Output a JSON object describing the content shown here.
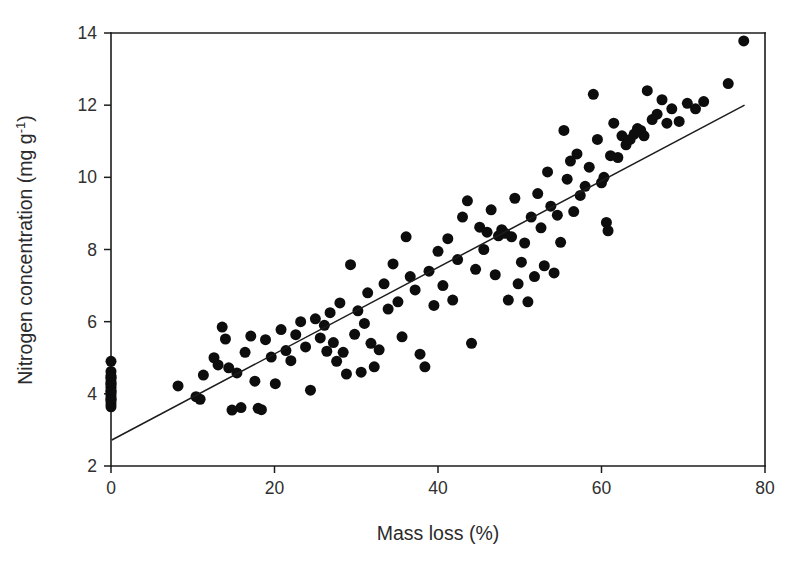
{
  "figure": {
    "background_color": "#ffffff",
    "marker_color": "#0d0d0d",
    "line_color": "#1c1c1c",
    "marker_diameter_px": 11
  },
  "axes": {
    "x_title": "Mass loss (%)",
    "y_title_main": "Nitrogen concentration (mg g",
    "y_title_sup": "-1",
    "y_title_close": ")",
    "x_ticks": [
      "0",
      "20",
      "40",
      "60",
      "80"
    ],
    "y_ticks": [
      "2",
      "4",
      "6",
      "8",
      "10",
      "12",
      "14"
    ]
  },
  "chart_data": {
    "type": "scatter",
    "title": "",
    "xlabel": "Mass loss (%)",
    "ylabel": "Nitrogen concentration (mg g-1)",
    "xlim": [
      0,
      80
    ],
    "ylim": [
      2,
      14
    ],
    "xticks": [
      0,
      20,
      40,
      60,
      80
    ],
    "yticks": [
      2,
      4,
      6,
      8,
      10,
      12,
      14
    ],
    "grid": false,
    "legend": null,
    "series": [
      {
        "name": "observations",
        "marker": "filled-circle",
        "color": "#0d0d0d",
        "points": [
          [
            0,
            4.9
          ],
          [
            0,
            4.62
          ],
          [
            0,
            4.5
          ],
          [
            0,
            4.42
          ],
          [
            0,
            4.33
          ],
          [
            0,
            4.25
          ],
          [
            0,
            4.18
          ],
          [
            0,
            4.1
          ],
          [
            0,
            4.02
          ],
          [
            0,
            3.95
          ],
          [
            0,
            3.88
          ],
          [
            0,
            3.8
          ],
          [
            0,
            3.72
          ],
          [
            0,
            3.64
          ],
          [
            0,
            4.46
          ],
          [
            0,
            4.28
          ],
          [
            0,
            4.06
          ],
          [
            0,
            3.84
          ],
          [
            8.2,
            4.22
          ],
          [
            10.4,
            3.92
          ],
          [
            10.9,
            3.85
          ],
          [
            11.3,
            4.52
          ],
          [
            12.6,
            5.0
          ],
          [
            13.1,
            4.8
          ],
          [
            13.6,
            5.85
          ],
          [
            14.0,
            5.52
          ],
          [
            14.4,
            4.72
          ],
          [
            14.8,
            3.55
          ],
          [
            15.4,
            4.58
          ],
          [
            15.9,
            3.62
          ],
          [
            16.4,
            5.15
          ],
          [
            17.1,
            5.6
          ],
          [
            17.6,
            4.35
          ],
          [
            18.0,
            3.6
          ],
          [
            18.4,
            3.56
          ],
          [
            18.9,
            5.5
          ],
          [
            19.6,
            5.02
          ],
          [
            20.1,
            4.28
          ],
          [
            20.8,
            5.78
          ],
          [
            21.4,
            5.2
          ],
          [
            22.0,
            4.92
          ],
          [
            22.6,
            5.64
          ],
          [
            23.2,
            6.0
          ],
          [
            23.8,
            5.3
          ],
          [
            24.4,
            4.1
          ],
          [
            25.0,
            6.08
          ],
          [
            25.6,
            5.55
          ],
          [
            26.1,
            5.9
          ],
          [
            26.4,
            5.18
          ],
          [
            26.8,
            6.25
          ],
          [
            27.2,
            5.42
          ],
          [
            27.6,
            4.9
          ],
          [
            28.0,
            6.52
          ],
          [
            28.4,
            5.15
          ],
          [
            28.8,
            4.55
          ],
          [
            29.3,
            7.58
          ],
          [
            29.8,
            5.65
          ],
          [
            30.2,
            6.3
          ],
          [
            30.6,
            4.6
          ],
          [
            31.0,
            5.95
          ],
          [
            31.4,
            6.8
          ],
          [
            31.8,
            5.4
          ],
          [
            32.2,
            4.75
          ],
          [
            32.8,
            5.22
          ],
          [
            33.4,
            7.05
          ],
          [
            33.9,
            6.35
          ],
          [
            34.5,
            7.6
          ],
          [
            35.1,
            6.55
          ],
          [
            35.6,
            5.58
          ],
          [
            36.1,
            8.35
          ],
          [
            36.6,
            7.25
          ],
          [
            37.2,
            6.88
          ],
          [
            37.8,
            5.1
          ],
          [
            38.4,
            4.75
          ],
          [
            38.9,
            7.4
          ],
          [
            39.5,
            6.45
          ],
          [
            40.0,
            7.95
          ],
          [
            40.6,
            7.0
          ],
          [
            41.2,
            8.3
          ],
          [
            41.8,
            6.6
          ],
          [
            42.4,
            7.72
          ],
          [
            43.0,
            8.9
          ],
          [
            43.6,
            9.35
          ],
          [
            44.1,
            5.4
          ],
          [
            44.6,
            7.45
          ],
          [
            45.1,
            8.62
          ],
          [
            45.6,
            8.0
          ],
          [
            46.0,
            8.48
          ],
          [
            46.5,
            9.1
          ],
          [
            47.0,
            7.3
          ],
          [
            47.4,
            8.38
          ],
          [
            47.8,
            8.55
          ],
          [
            48.2,
            8.45
          ],
          [
            48.6,
            6.6
          ],
          [
            49.0,
            8.35
          ],
          [
            49.4,
            9.42
          ],
          [
            49.8,
            7.05
          ],
          [
            50.2,
            7.65
          ],
          [
            50.6,
            8.18
          ],
          [
            51.0,
            6.55
          ],
          [
            51.4,
            8.9
          ],
          [
            51.8,
            7.25
          ],
          [
            52.2,
            9.55
          ],
          [
            52.6,
            8.6
          ],
          [
            53.0,
            7.55
          ],
          [
            53.4,
            10.15
          ],
          [
            53.8,
            9.2
          ],
          [
            54.2,
            7.35
          ],
          [
            54.6,
            8.95
          ],
          [
            55.0,
            8.2
          ],
          [
            55.4,
            11.3
          ],
          [
            55.8,
            9.95
          ],
          [
            56.2,
            10.45
          ],
          [
            56.6,
            9.05
          ],
          [
            57.0,
            10.65
          ],
          [
            57.4,
            9.5
          ],
          [
            58.0,
            9.75
          ],
          [
            58.5,
            10.28
          ],
          [
            59.0,
            12.3
          ],
          [
            59.5,
            11.05
          ],
          [
            60.0,
            9.85
          ],
          [
            60.3,
            10.0
          ],
          [
            60.6,
            8.75
          ],
          [
            60.8,
            8.52
          ],
          [
            61.1,
            10.6
          ],
          [
            61.5,
            11.5
          ],
          [
            62.0,
            10.55
          ],
          [
            62.5,
            11.15
          ],
          [
            63.0,
            10.9
          ],
          [
            63.5,
            11.05
          ],
          [
            64.0,
            11.2
          ],
          [
            64.4,
            11.35
          ],
          [
            64.8,
            11.3
          ],
          [
            65.2,
            11.15
          ],
          [
            65.6,
            12.4
          ],
          [
            66.2,
            11.6
          ],
          [
            66.8,
            11.75
          ],
          [
            67.4,
            12.15
          ],
          [
            68.0,
            11.5
          ],
          [
            68.6,
            11.9
          ],
          [
            69.5,
            11.55
          ],
          [
            70.5,
            12.05
          ],
          [
            71.5,
            11.9
          ],
          [
            72.5,
            12.1
          ],
          [
            75.5,
            12.6
          ],
          [
            77.4,
            13.78
          ]
        ]
      }
    ],
    "fit_line": {
      "name": "linear regression",
      "x_start": 0.1,
      "y_start": 2.72,
      "x_end": 77.5,
      "y_end": 12.0
    }
  }
}
